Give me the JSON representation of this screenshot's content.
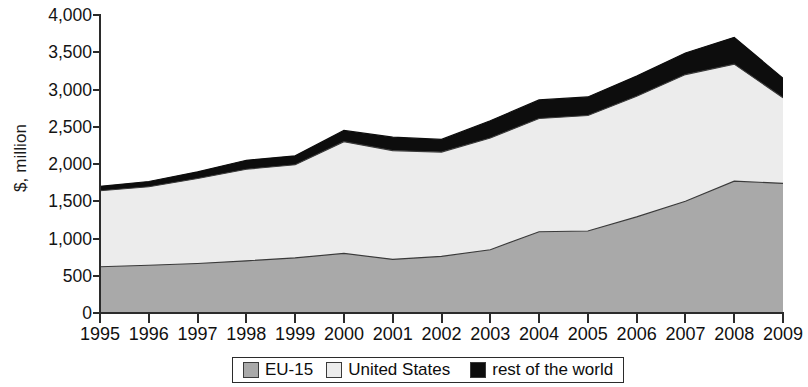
{
  "chart_data": {
    "type": "area",
    "stacked": true,
    "title": "",
    "subtitle": "",
    "xlabel": "",
    "ylabel": "$, million",
    "xlim": [
      1995,
      2009
    ],
    "ylim": [
      0,
      4000
    ],
    "ytick_step": 500,
    "grid": false,
    "legend_position": "bottom",
    "categories": [
      "1995",
      "1996",
      "1997",
      "1998",
      "1999",
      "2000",
      "2001",
      "2002",
      "2003",
      "2004",
      "2005",
      "2006",
      "2007",
      "2008",
      "2009"
    ],
    "x": [
      1995,
      1996,
      1997,
      1998,
      1999,
      2000,
      2001,
      2002,
      2003,
      2004,
      2005,
      2006,
      2007,
      2008,
      2009
    ],
    "ytick_labels": [
      "0",
      "500",
      "1,000",
      "1,500",
      "2,000",
      "2,500",
      "3,000",
      "3,500",
      "4,000"
    ],
    "ytick_values": [
      0,
      500,
      1000,
      1500,
      2000,
      2500,
      3000,
      3500,
      4000
    ],
    "series": [
      {
        "name": "EU-15",
        "color": "#a9a9a9",
        "values": [
          620,
          640,
          665,
          700,
          740,
          800,
          720,
          760,
          850,
          1090,
          1100,
          1290,
          1500,
          1770,
          1740
        ]
      },
      {
        "name": "United States",
        "color": "#ececec",
        "values": [
          1020,
          1055,
          1140,
          1230,
          1250,
          1500,
          1460,
          1400,
          1500,
          1520,
          1550,
          1620,
          1700,
          1570,
          1150
        ]
      },
      {
        "name": "rest of the world",
        "color": "#0d0d0d",
        "values": [
          60,
          70,
          90,
          120,
          120,
          150,
          180,
          170,
          230,
          250,
          250,
          270,
          290,
          360,
          260
        ]
      }
    ],
    "cumulative_totals": [
      1700,
      1765,
      1895,
      2050,
      2110,
      2450,
      2360,
      2330,
      2580,
      2860,
      2900,
      3180,
      3490,
      3700,
      3150
    ]
  },
  "axis": {
    "y_title": "$, million"
  },
  "legend": {
    "items": [
      {
        "label": "EU-15",
        "swatch": "#a9a9a9"
      },
      {
        "label": "United States",
        "swatch": "#ececec"
      },
      {
        "label": "rest of the world",
        "swatch": "#0d0d0d"
      }
    ]
  }
}
